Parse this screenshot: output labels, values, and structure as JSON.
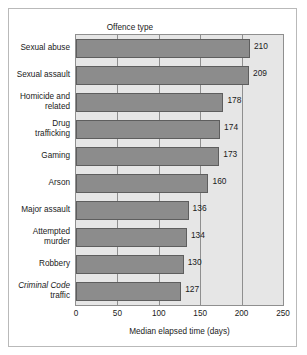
{
  "figure": {
    "header_label": "Offence type"
  },
  "chart_data": {
    "type": "bar",
    "orientation": "horizontal",
    "title": "",
    "xlabel": "Median elapsed time (days)",
    "ylabel": "Offence type",
    "xlim": [
      0,
      250
    ],
    "xticks": [
      0,
      50,
      100,
      150,
      200,
      250
    ],
    "xtick_labels": [
      "0",
      "50",
      "100",
      "150",
      "200",
      "250"
    ],
    "grid": true,
    "legend": null,
    "bar_color": "#8c8c8c",
    "plot_background": "#e6e6e6",
    "categories": [
      "Sexual abuse",
      "Sexual assault",
      "Homicide and related",
      "Drug trafficking",
      "Gaming",
      "Arson",
      "Major assault",
      "Attempted murder",
      "Robbery",
      "Criminal Code traffic"
    ],
    "category_lines": [
      [
        "Sexual abuse"
      ],
      [
        "Sexual assault"
      ],
      [
        "Homicide and",
        "related"
      ],
      [
        "Drug",
        "trafficking"
      ],
      [
        "Gaming"
      ],
      [
        "Arson"
      ],
      [
        "Major assault"
      ],
      [
        "Attempted",
        "murder"
      ],
      [
        "Robbery"
      ],
      [
        "Criminal Code",
        "traffic"
      ]
    ],
    "category_italic_first_line": [
      false,
      false,
      false,
      false,
      false,
      false,
      false,
      false,
      false,
      true
    ],
    "values": [
      210,
      209,
      178,
      174,
      173,
      160,
      136,
      134,
      130,
      127
    ],
    "value_labels": [
      "210",
      "209",
      "178",
      "174",
      "173",
      "160",
      "136",
      "134",
      "130",
      "127"
    ]
  }
}
